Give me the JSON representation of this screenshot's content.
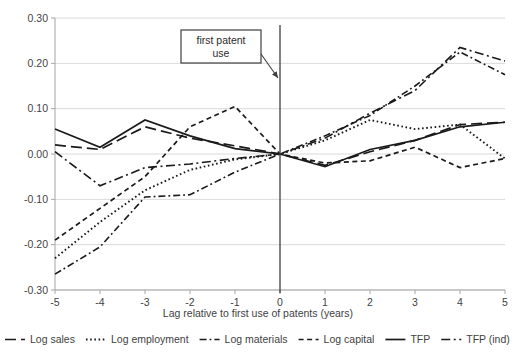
{
  "chart_data": {
    "type": "line",
    "title": "",
    "xlabel": "Lag relative to first use of patents (years)",
    "ylabel": "",
    "x": [
      -5,
      -4,
      -3,
      -2,
      -1,
      0,
      1,
      2,
      3,
      4,
      5
    ],
    "xtick_labels": [
      "-5",
      "-4",
      "-3",
      "-2",
      "-1",
      "0",
      "1",
      "2",
      "3",
      "4",
      "5"
    ],
    "ytick_labels": [
      "-0.30",
      "-0.20",
      "-0.10",
      "0.00",
      "0.10",
      "0.20",
      "0.30"
    ],
    "ytick_values": [
      -0.3,
      -0.2,
      -0.1,
      0.0,
      0.1,
      0.2,
      0.3
    ],
    "ylim": [
      -0.3,
      0.3
    ],
    "xlim": [
      -5,
      5
    ],
    "grid": true,
    "legend_position": "bottom",
    "series": [
      {
        "name": "Log sales",
        "dash": "long-dash",
        "values": [
          0.02,
          0.01,
          0.06,
          0.035,
          0.018,
          0.0,
          -0.025,
          0.005,
          0.03,
          0.065,
          0.07
        ]
      },
      {
        "name": "Log employment",
        "dash": "dotted",
        "values": [
          -0.23,
          -0.15,
          -0.08,
          -0.035,
          -0.012,
          0.0,
          0.03,
          0.075,
          0.055,
          0.065,
          -0.01
        ]
      },
      {
        "name": "Log materials",
        "dash": "dash-dot",
        "values": [
          -0.265,
          -0.205,
          -0.095,
          -0.09,
          -0.04,
          0.0,
          0.04,
          0.085,
          0.15,
          0.225,
          0.175
        ]
      },
      {
        "name": "Log capital",
        "dash": "short-dash",
        "values": [
          -0.19,
          -0.12,
          -0.05,
          0.06,
          0.105,
          0.0,
          -0.02,
          -0.015,
          0.015,
          -0.03,
          -0.01
        ]
      },
      {
        "name": "TFP",
        "dash": "solid",
        "values": [
          0.055,
          0.015,
          0.075,
          0.04,
          0.012,
          0.0,
          -0.028,
          0.01,
          0.03,
          0.06,
          0.07
        ]
      },
      {
        "name": "TFP (ind)",
        "dash": "long-dash-dot",
        "values": [
          0.005,
          -0.07,
          -0.03,
          -0.022,
          -0.01,
          0.0,
          0.035,
          0.09,
          0.14,
          0.235,
          0.205
        ]
      }
    ],
    "annotations": [
      {
        "text_line1": "first patent",
        "text_line2": "use",
        "points_to_x": 0,
        "vertical_line_x": 0
      }
    ]
  },
  "colors": {
    "line": "#1a1a1a",
    "grid": "#d9d9d9",
    "axis": "#a6a6a6",
    "text": "#3f3f3f",
    "background": "#ffffff"
  }
}
